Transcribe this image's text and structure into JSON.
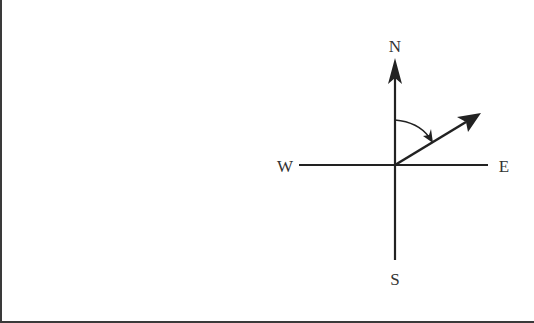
{
  "diagram": {
    "type": "compass-bearing",
    "labels": {
      "north": "N",
      "south": "S",
      "east": "E",
      "west": "W"
    },
    "origin": {
      "x": 395,
      "y": 165
    },
    "axes": {
      "north_tip": {
        "x": 395,
        "y": 58
      },
      "south_end": {
        "x": 395,
        "y": 260
      },
      "west_end": {
        "x": 299,
        "y": 165
      },
      "east_end": {
        "x": 488,
        "y": 165
      }
    },
    "bearing_vector": {
      "from": {
        "x": 395,
        "y": 165
      },
      "to": {
        "x": 481,
        "y": 113
      },
      "description": "arrow pointing north-east, angle measured clockwise from north"
    },
    "angle_arc": {
      "from": "north",
      "to": "bearing_vector",
      "direction": "clockwise"
    },
    "colors": {
      "stroke": "#222222",
      "text": "#333333",
      "border": "#3a3a3a",
      "background": "#ffffff"
    }
  }
}
